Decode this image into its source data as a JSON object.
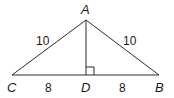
{
  "diagram": {
    "type": "triangle",
    "vertices": [
      {
        "id": "A",
        "label": "A",
        "x": 86,
        "y": 20
      },
      {
        "id": "C",
        "label": "C",
        "x": 12,
        "y": 75
      },
      {
        "id": "D",
        "label": "D",
        "x": 86,
        "y": 75
      },
      {
        "id": "B",
        "label": "B",
        "x": 159,
        "y": 75
      }
    ],
    "segments": [
      {
        "from": "A",
        "to": "C",
        "length_label": "10"
      },
      {
        "from": "A",
        "to": "B",
        "length_label": "10"
      },
      {
        "from": "C",
        "to": "D",
        "length_label": "8"
      },
      {
        "from": "D",
        "to": "B",
        "length_label": "8"
      },
      {
        "from": "A",
        "to": "D",
        "length_label": ""
      }
    ],
    "right_angle_at": "D",
    "labels": {
      "A": "A",
      "B": "B",
      "C": "C",
      "D": "D",
      "AC": "10",
      "AB": "10",
      "CD": "8",
      "DB": "8"
    },
    "stroke_color": "#2b2b2b"
  }
}
